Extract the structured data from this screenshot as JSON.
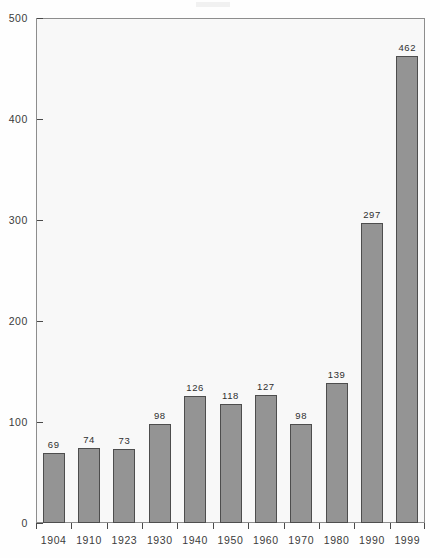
{
  "chart_data": {
    "type": "bar",
    "title": "",
    "subtitle": "",
    "xlabel": "",
    "ylabel": "",
    "categories": [
      "1904",
      "1910",
      "1923",
      "1930",
      "1940",
      "1950",
      "1960",
      "1970",
      "1980",
      "1990",
      "1999"
    ],
    "values": [
      69,
      74,
      73,
      98,
      126,
      118,
      127,
      98,
      139,
      297,
      462
    ],
    "value_labels": [
      "69",
      "74",
      "73",
      "98",
      "126",
      "118",
      "127",
      "98",
      "139",
      "297",
      "462"
    ],
    "ylim": [
      0,
      500
    ],
    "ytick_values": [
      0,
      100,
      200,
      300,
      400,
      500
    ],
    "ytick_labels": [
      "0",
      "100",
      "200",
      "300",
      "400",
      "500"
    ],
    "grid": false,
    "legend": "none",
    "bar_color": "#949494",
    "bar_edge_color": "#4d4d4d",
    "plot_background": "#f8f8f8",
    "axis_color": "#4a4a4a",
    "text_color": "#3b3b3b"
  }
}
